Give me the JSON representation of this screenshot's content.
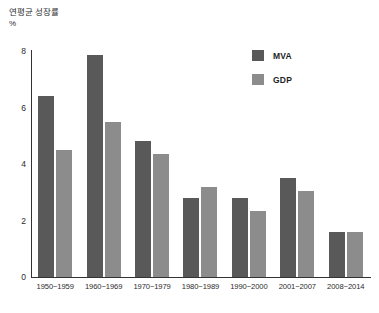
{
  "axis_titles": {
    "y_title": "연평균 성장률",
    "y_unit": "%"
  },
  "legend": {
    "mva_label": "MVA",
    "gdp_label": "GDP",
    "mva_color": "#595959",
    "gdp_color": "#8c8c8c"
  },
  "chart_data": {
    "type": "bar",
    "title": "",
    "subtitle": "",
    "xlabel": "",
    "ylabel": "연평균 성장률 %",
    "ylim": [
      0,
      8
    ],
    "yticks": [
      0,
      2,
      4,
      6,
      8
    ],
    "ytick_labels": [
      "0",
      "2",
      "4",
      "6",
      "8"
    ],
    "grid": false,
    "legend_position": "top-right",
    "categories": [
      "1950~1959",
      "1960~1969",
      "1970~1979",
      "1980~1989",
      "1990~2000",
      "2001~2007",
      "2008~2014"
    ],
    "series": [
      {
        "name": "MVA",
        "color": "#595959",
        "values": [
          6.4,
          7.85,
          4.8,
          2.8,
          2.8,
          3.5,
          1.6
        ]
      },
      {
        "name": "GDP",
        "color": "#8c8c8c",
        "values": [
          4.5,
          5.5,
          4.35,
          3.2,
          2.35,
          3.05,
          1.6
        ]
      }
    ]
  }
}
